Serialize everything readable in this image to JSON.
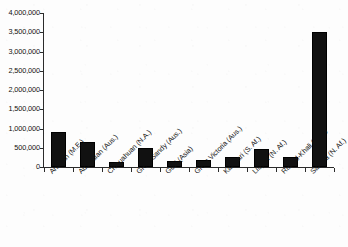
{
  "chart_data": {
    "type": "bar",
    "title": "",
    "subtitle": "",
    "xlabel": "",
    "ylabel": "",
    "ylim": [
      0,
      4000000
    ],
    "grid": false,
    "legend": false,
    "legend_position": "none",
    "bar_color": "#111111",
    "axis_color": "#2b2b2b",
    "background_color": "#fdfdfd",
    "ytick_labels": [
      "4,000,000",
      "3,500,000",
      "3,000,000",
      "2,500,000",
      "2,000,000",
      "1,500,000",
      "1,000,000",
      "500,000",
      "0"
    ],
    "ytick_values": [
      4000000,
      3500000,
      3000000,
      2500000,
      2000000,
      1500000,
      1000000,
      500000,
      0
    ],
    "categories": [
      "Arabian (M.E.)",
      "Australian (Aus.)",
      "Chihuahuan (N.A.)",
      "Great Sandy (Aus.)",
      "Gobi (Asia)",
      "Great Victoria (Aus.)",
      "Kalahari (S. Af.)",
      "Libyan (N. Af.)",
      "Rub' al-Khali (M.E.)",
      "Sahara (N. Af.)"
    ],
    "values": [
      900000,
      640000,
      140000,
      500000,
      160000,
      180000,
      260000,
      480000,
      250000,
      3500000
    ]
  }
}
